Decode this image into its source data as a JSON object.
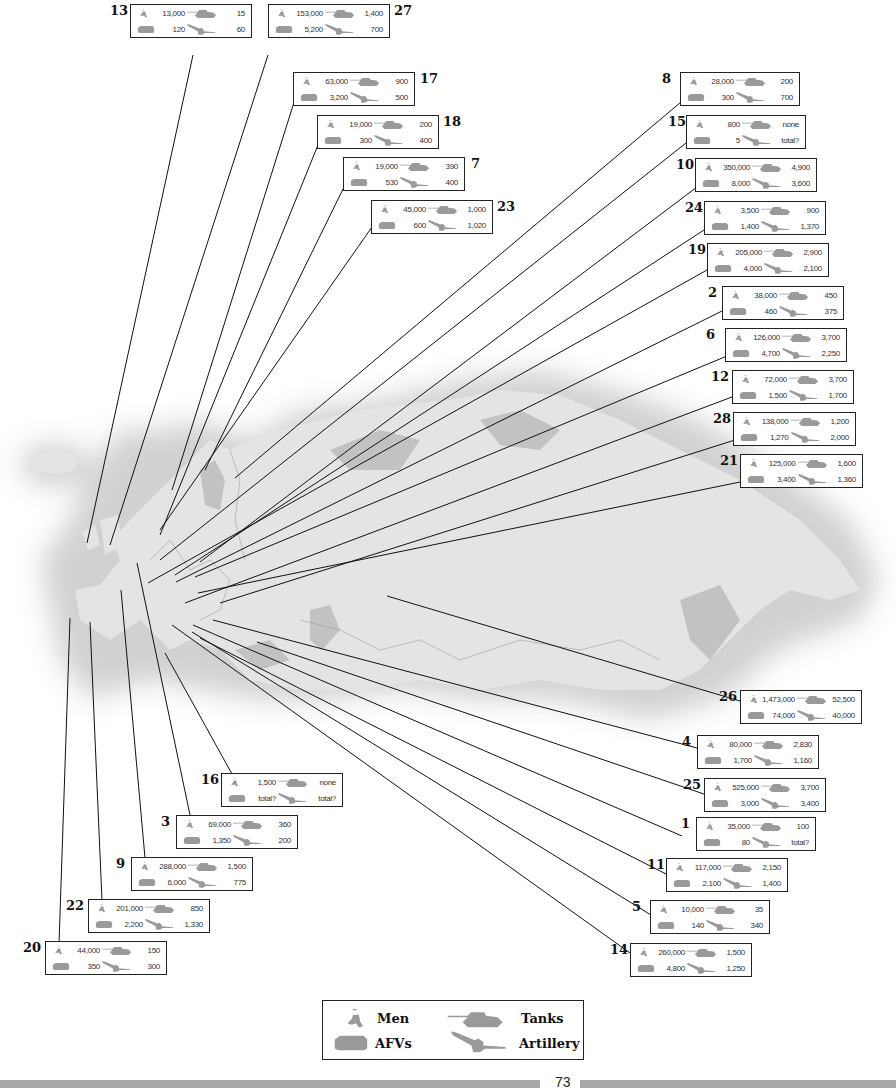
{
  "legend": {
    "men": "Men",
    "tanks": "Tanks",
    "afvs": "AFVs",
    "artillery": "Artillery"
  },
  "page_number": "73",
  "countries": [
    {
      "id": "13",
      "men": "13,000",
      "tanks": "15",
      "afvs": "120",
      "artillery": "60"
    },
    {
      "id": "27",
      "men": "153,000",
      "tanks": "1,400",
      "afvs": "5,200",
      "artillery": "700"
    },
    {
      "id": "17",
      "men": "63,000",
      "tanks": "900",
      "afvs": "3,200",
      "artillery": "500"
    },
    {
      "id": "18",
      "men": "19,000",
      "tanks": "200",
      "afvs": "300",
      "artillery": "400"
    },
    {
      "id": "7",
      "men": "19,000",
      "tanks": "390",
      "afvs": "530",
      "artillery": "400"
    },
    {
      "id": "23",
      "men": "45,000",
      "tanks": "1,000",
      "afvs": "600",
      "artillery": "1,020"
    },
    {
      "id": "8",
      "men": "28,000",
      "tanks": "200",
      "afvs": "300",
      "artillery": "700"
    },
    {
      "id": "15",
      "men": "800",
      "tanks": "none",
      "afvs": "5",
      "artillery": "total?"
    },
    {
      "id": "10",
      "men": "350,000",
      "tanks": "4,900",
      "afvs": "8,000",
      "artillery": "3,600"
    },
    {
      "id": "24",
      "men": "3,500",
      "tanks": "900",
      "afvs": "1,400",
      "artillery": "1,370"
    },
    {
      "id": "19",
      "men": "205,000",
      "tanks": "2,900",
      "afvs": "4,000",
      "artillery": "2,100"
    },
    {
      "id": "2",
      "men": "38,000",
      "tanks": "450",
      "afvs": "460",
      "artillery": "375"
    },
    {
      "id": "6",
      "men": "126,000",
      "tanks": "3,700",
      "afvs": "4,700",
      "artillery": "2,250"
    },
    {
      "id": "12",
      "men": "72,000",
      "tanks": "3,700",
      "afvs": "1,500",
      "artillery": "1,700"
    },
    {
      "id": "28",
      "men": "138,000",
      "tanks": "1,200",
      "afvs": "1,270",
      "artillery": "2,000"
    },
    {
      "id": "21",
      "men": "125,000",
      "tanks": "1,600",
      "afvs": "3,400",
      "artillery": "1,360"
    },
    {
      "id": "26",
      "men": "1,473,000",
      "tanks": "52,500",
      "afvs": "74,000",
      "artillery": "40,000"
    },
    {
      "id": "4",
      "men": "80,000",
      "tanks": "2,830",
      "afvs": "1,700",
      "artillery": "1,160"
    },
    {
      "id": "25",
      "men": "525,000",
      "tanks": "3,700",
      "afvs": "3,000",
      "artillery": "3,400"
    },
    {
      "id": "1",
      "men": "35,000",
      "tanks": "100",
      "afvs": "80",
      "artillery": "total?"
    },
    {
      "id": "11",
      "men": "117,000",
      "tanks": "2,150",
      "afvs": "2,100",
      "artillery": "1,400"
    },
    {
      "id": "5",
      "men": "10,000",
      "tanks": "35",
      "afvs": "140",
      "artillery": "340"
    },
    {
      "id": "14",
      "men": "260,000",
      "tanks": "1,500",
      "afvs": "4,800",
      "artillery": "1,250"
    },
    {
      "id": "16",
      "men": "1,500",
      "tanks": "none",
      "afvs": "total?",
      "artillery": "total?"
    },
    {
      "id": "3",
      "men": "69,000",
      "tanks": "360",
      "afvs": "1,350",
      "artillery": "200"
    },
    {
      "id": "9",
      "men": "288,000",
      "tanks": "1,500",
      "afvs": "6,000",
      "artillery": "775"
    },
    {
      "id": "22",
      "men": "201,000",
      "tanks": "850",
      "afvs": "2,200",
      "artillery": "1,330"
    },
    {
      "id": "20",
      "men": "44,000",
      "tanks": "150",
      "afvs": "350",
      "artillery": "300"
    }
  ]
}
